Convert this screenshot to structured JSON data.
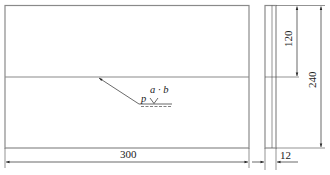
{
  "drawing": {
    "type": "weld plate drawing",
    "front_view": {
      "dimension_width": "300",
      "weld_symbol": {
        "top_label": "a · b",
        "left_label": "p",
        "symbol": "V-groove"
      }
    },
    "side_view": {
      "dimension_thickness": "12",
      "dimension_height_half": "120",
      "dimension_height_total": "240"
    },
    "colors": {
      "outline": "#8a8a8a",
      "dimension": "#2a2a2a",
      "background": "#ffffff"
    }
  }
}
